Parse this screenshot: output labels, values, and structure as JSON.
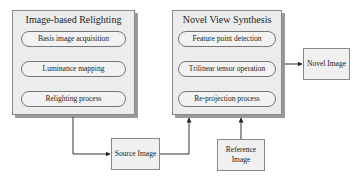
{
  "panels": [
    {
      "title": "Image-based Relighting",
      "steps": [
        "Basis image acquisition",
        "Luminance mapping",
        "Relighting process"
      ]
    },
    {
      "title": "Novel View Synthesis",
      "steps": [
        "Feature point detection",
        "Trilinear tensor operation",
        "Re-projection process"
      ]
    }
  ],
  "boxes": {
    "source": "Source Image",
    "reference": "Reference Image",
    "novel": "Novel Image"
  }
}
